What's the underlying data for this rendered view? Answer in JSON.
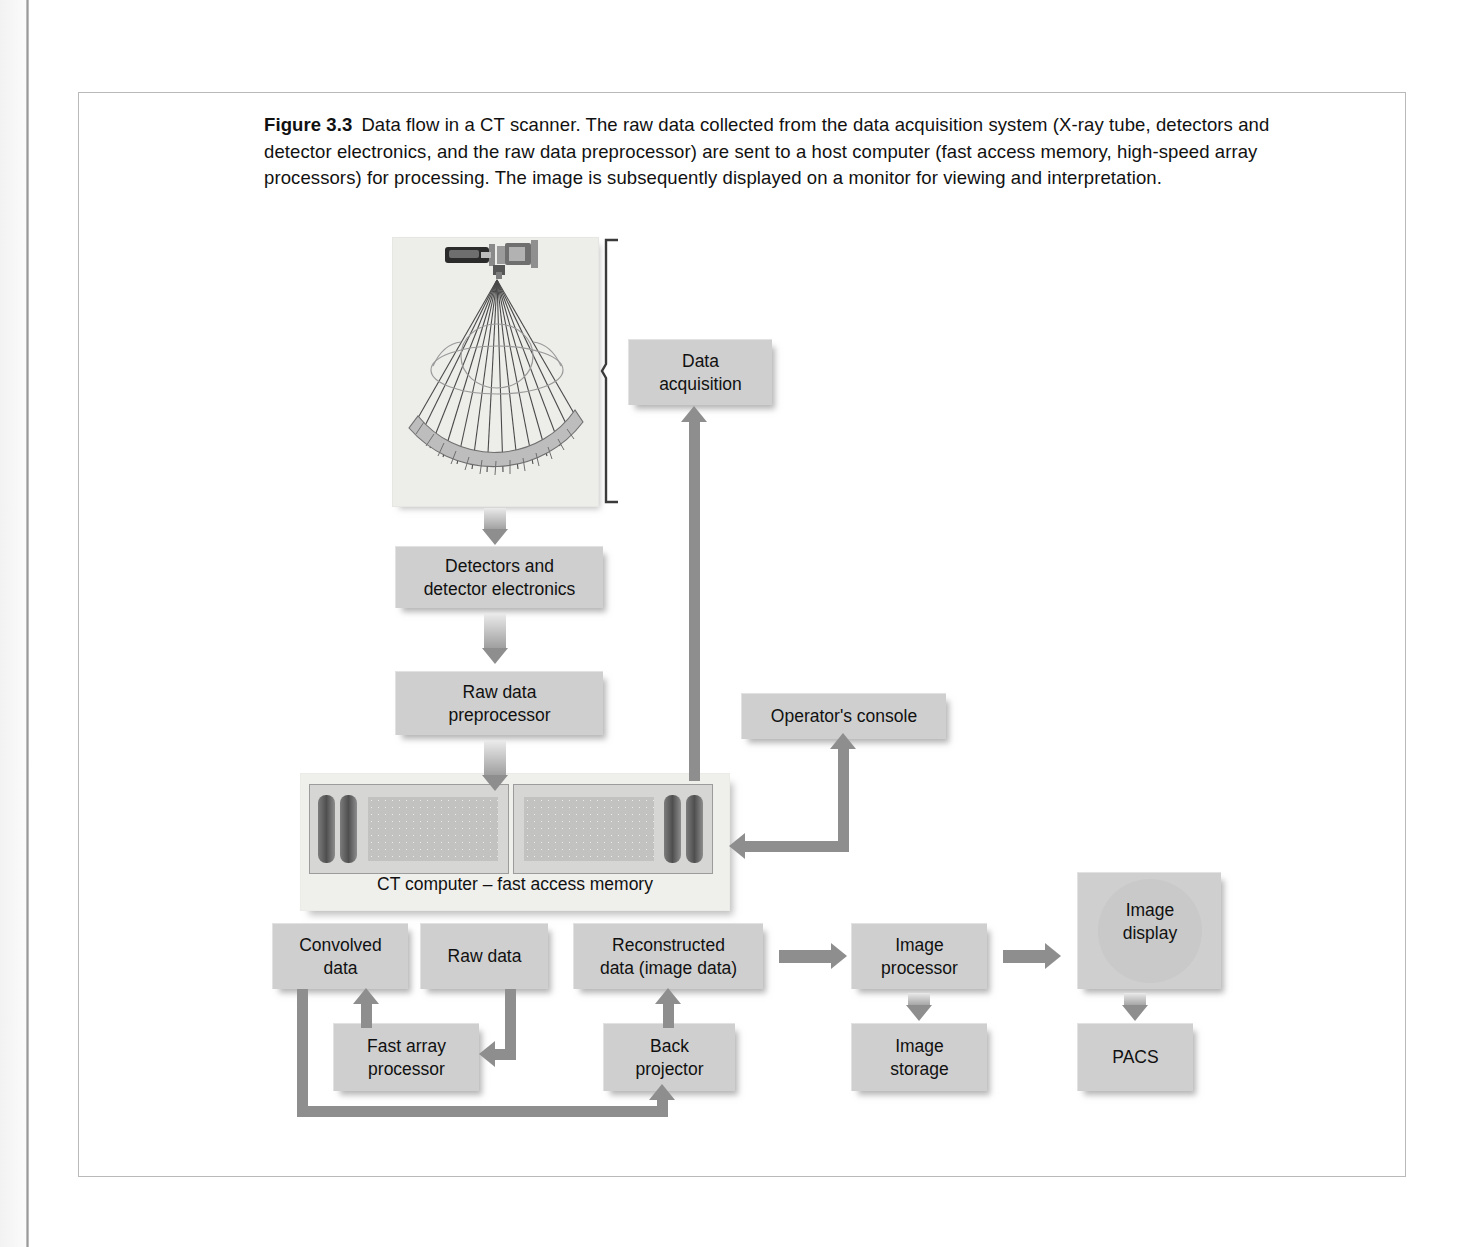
{
  "caption": {
    "figure_number": "Figure 3.3",
    "text": "Data flow in a CT scanner. The raw data collected from the data acquisition system (X-ray tube, detectors and detector electronics, and the raw data preprocessor) are sent to a host computer (fast access memory, high-speed array processors) for processing. The image is subsequently displayed on a monitor for viewing and interpretation."
  },
  "diagram": {
    "nodes": {
      "data_acquisition": "Data\nacquisition",
      "detectors": "Detectors and\ndetector electronics",
      "raw_data_preprocessor": "Raw data\npreprocessor",
      "operators_console": "Operator's console",
      "ct_computer": "CT computer – fast access memory",
      "convolved_data": "Convolved\ndata",
      "raw_data": "Raw data",
      "reconstructed_data": "Reconstructed\ndata (image data)",
      "image_processor": "Image\nprocessor",
      "image_display": "Image\ndisplay",
      "fast_array_processor": "Fast array\nprocessor",
      "back_projector": "Back\nprojector",
      "image_storage": "Image\nstorage",
      "pacs": "PACS"
    },
    "illustration": {
      "name": "ct-gantry-fan-beam",
      "parts": [
        "x-ray-tube",
        "collimator",
        "fan-beam-rays",
        "patient-cross-section",
        "detector-arc"
      ],
      "ray_count": 13,
      "detector_segments": 16
    },
    "colors": {
      "node_fill": "#cfcfcf",
      "arrow": "#8e8e8e",
      "panel_bg": "#efefec",
      "frame_border": "#b9b9b9",
      "text": "#111111"
    }
  }
}
